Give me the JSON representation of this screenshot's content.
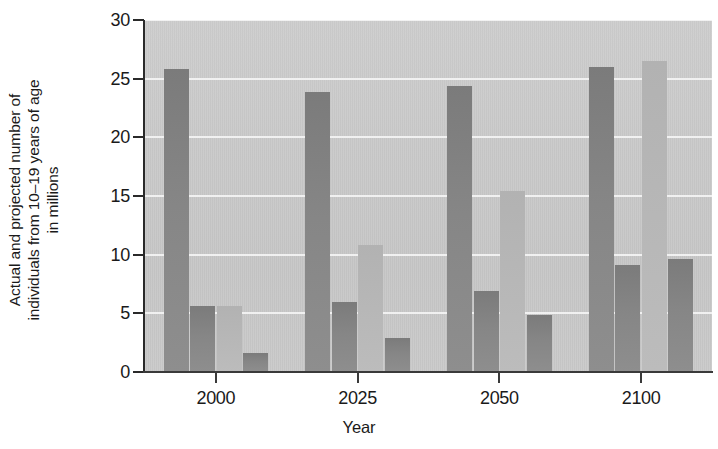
{
  "chart_data": {
    "type": "bar",
    "title": "",
    "xlabel": "Year",
    "ylabel": "Actual and projected number of individuals from 10–19 years of age in millions",
    "ylabel_lines": [
      "Actual and projected number of",
      "individuals from 10–19 years of age",
      "in millions"
    ],
    "categories": [
      "2000",
      "2025",
      "2050",
      "2100"
    ],
    "ylim": [
      0,
      30
    ],
    "yticks": [
      0,
      5,
      10,
      15,
      20,
      25,
      30
    ],
    "ytick_labels": [
      "0",
      "5",
      "10",
      "15",
      "20",
      "25",
      "30"
    ],
    "grid": true,
    "grid_axis": "y",
    "legend": false,
    "legend_position": "none",
    "bars_per_group": 4,
    "series": [
      {
        "name": "Series 1",
        "shade": "dark",
        "values": [
          25.8,
          23.9,
          24.4,
          26.0
        ]
      },
      {
        "name": "Series 2",
        "shade": "dark",
        "values": [
          5.6,
          6.0,
          6.9,
          9.1
        ]
      },
      {
        "name": "Series 3",
        "shade": "light",
        "values": [
          5.6,
          10.8,
          15.4,
          26.5
        ]
      },
      {
        "name": "Series 4",
        "shade": "dark",
        "values": [
          1.6,
          2.9,
          4.9,
          9.6
        ]
      }
    ],
    "colors": {
      "bar_dark": "#868686",
      "bar_light": "#b7b7b7",
      "plot_background": "#c9c9c9",
      "gridline": "#f4f4f4",
      "axis": "#2a2a2a",
      "text": "#1a1a1a",
      "page_background": "#ffffff"
    }
  }
}
